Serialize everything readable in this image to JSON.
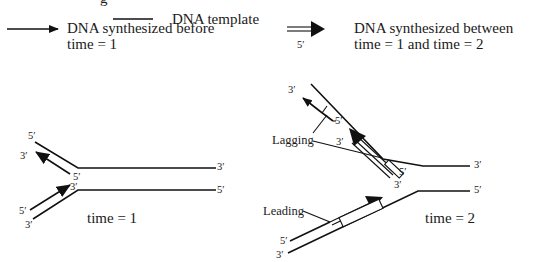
{
  "legend": {
    "partial_top_glyph": "g",
    "template_label": "DNA template",
    "before_label_line1": "DNA synthesized before",
    "before_label_line2": "time = 1",
    "between_label_line1": "DNA synthesized between",
    "between_label_line2": "time = 1 and time = 2",
    "double_arrow_end_label": "5′"
  },
  "fork_time1": {
    "caption": "time = 1",
    "labels": {
      "top_template_5": "5′",
      "top_new_3": "3′",
      "top_new_5": "5′",
      "right_top_3": "3′",
      "bottom_new_3": "3′",
      "right_bottom_5": "5′",
      "bottom_new_5": "5′",
      "bottom_template_3": "3′"
    }
  },
  "fork_time2": {
    "caption": "time = 2",
    "lagging_label": "Lagging",
    "leading_label": "Leading",
    "labels": {
      "top_old_fragment_3": "3′",
      "top_old_fragment_5": "5′",
      "top_template_5": "5′",
      "new_okazaki_3": "3′",
      "new_okazaki_5": "5′",
      "right_top_3": "3′",
      "leading_3": "3′",
      "right_bottom_5": "5′",
      "bottom_new_5": "5′",
      "bottom_template_3": "3′"
    }
  },
  "colors": {
    "ink": "#111111",
    "background": "#ffffff"
  }
}
